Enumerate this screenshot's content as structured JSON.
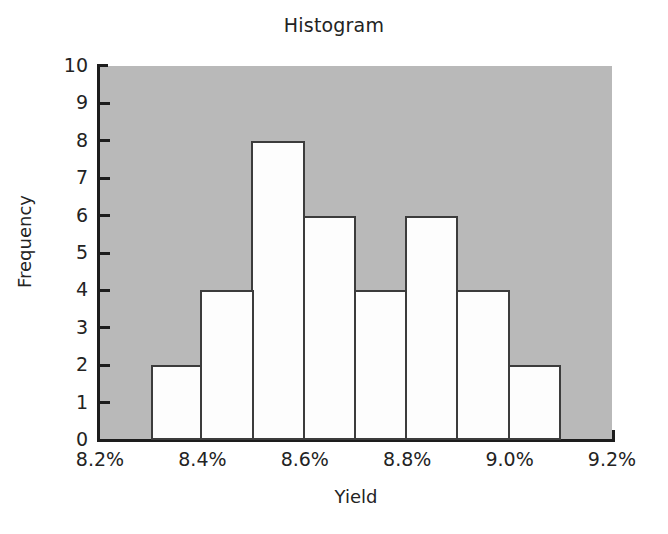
{
  "chart_data": {
    "type": "bar",
    "title": "Histogram",
    "xlabel": "Yield",
    "ylabel": "Frequency",
    "categories": [
      "8.3%-8.4%",
      "8.4%-8.5%",
      "8.5%-8.6%",
      "8.6%-8.7%",
      "8.7%-8.8%",
      "8.8%-8.9%",
      "8.9%-9.0%",
      "9.0%-9.1%"
    ],
    "bin_edges": [
      8.3,
      8.4,
      8.5,
      8.6,
      8.7,
      8.8,
      8.9,
      9.0,
      9.1
    ],
    "values": [
      2,
      4,
      8,
      6,
      4,
      6,
      4,
      2
    ],
    "bars": [
      {
        "label": "8.3%-8.4%",
        "bin_start": 8.3,
        "bin_end": 8.4,
        "value": 2
      },
      {
        "label": "8.4%-8.5%",
        "bin_start": 8.4,
        "bin_end": 8.5,
        "value": 4
      },
      {
        "label": "8.5%-8.6%",
        "bin_start": 8.5,
        "bin_end": 8.6,
        "value": 8
      },
      {
        "label": "8.6%-8.7%",
        "bin_start": 8.6,
        "bin_end": 8.7,
        "value": 6
      },
      {
        "label": "8.7%-8.8%",
        "bin_start": 8.7,
        "bin_end": 8.8,
        "value": 4
      },
      {
        "label": "8.8%-8.9%",
        "bin_start": 8.8,
        "bin_end": 8.9,
        "value": 6
      },
      {
        "label": "8.9%-9.0%",
        "bin_start": 8.9,
        "bin_end": 9.0,
        "value": 4
      },
      {
        "label": "9.0%-9.1%",
        "bin_start": 9.0,
        "bin_end": 9.1,
        "value": 2
      }
    ],
    "xlim": [
      8.2,
      9.2
    ],
    "ylim": [
      0,
      10
    ],
    "y_ticks": [
      0,
      1,
      2,
      3,
      4,
      5,
      6,
      7,
      8,
      9,
      10
    ],
    "y_tick_labels": [
      "0",
      "1",
      "2",
      "3",
      "4",
      "5",
      "6",
      "7",
      "8",
      "9",
      "10"
    ],
    "x_ticks": [
      8.2,
      8.4,
      8.6,
      8.8,
      9.0,
      9.2
    ],
    "x_tick_labels": [
      "8.2%",
      "8.4%",
      "8.6%",
      "8.8%",
      "9.0%",
      "9.2%"
    ],
    "grid": false,
    "legend": null,
    "total_frequency": 36,
    "colors": {
      "plot_background": "#b9b9b9",
      "bar_fill": "#fdfdfd",
      "bar_edge": "#3c3c3c",
      "axis": "#1d1d1d",
      "text": "#232323",
      "figure_background": "#ffffff"
    }
  }
}
